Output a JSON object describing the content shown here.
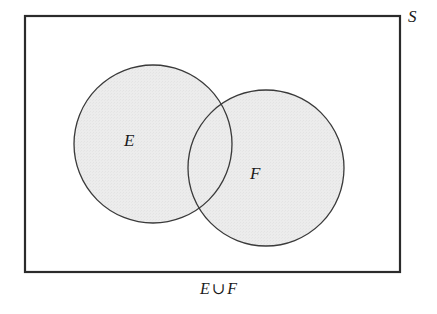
{
  "figure": {
    "type": "venn-diagram",
    "caption": {
      "left_set": "E",
      "operator": "∪",
      "right_set": "F",
      "full_text": "E ∪ F"
    },
    "universal_set_label": "S",
    "set_labels": {
      "left": "E",
      "right": "F"
    },
    "colors": {
      "fill": "#ebebeb",
      "outline": "#3a3a3a",
      "rectangle_border": "#2b2b2b",
      "text": "#1a1a1a",
      "background": "#ffffff"
    },
    "geometry": {
      "rectangle": {
        "x": 25,
        "y": 16,
        "width": 375,
        "height": 256,
        "stroke_width": 2.2
      },
      "circle_left": {
        "cx": 153,
        "cy": 144,
        "r": 79,
        "stroke_width": 1.3
      },
      "circle_right": {
        "cx": 266,
        "cy": 168,
        "r": 78,
        "stroke_width": 1.3
      }
    }
  }
}
